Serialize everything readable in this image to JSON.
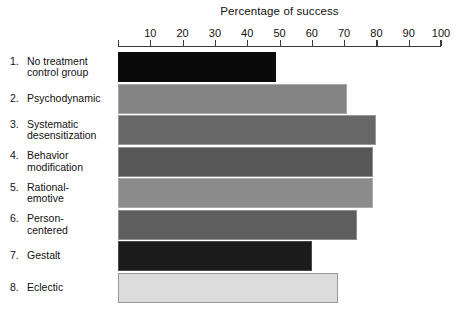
{
  "chart_data": {
    "type": "bar",
    "orientation": "horizontal",
    "title": "Percentage of success",
    "xlabel": "",
    "ylabel": "",
    "xlim": [
      0,
      100
    ],
    "xticks": [
      10,
      20,
      30,
      40,
      50,
      60,
      70,
      80,
      90,
      100
    ],
    "grid": false,
    "legend": null,
    "categories": [
      "No treatment control group",
      "Psychodynamic",
      "Systematic desensitization",
      "Behavior modification",
      "Rational-emotive",
      "Person-centered",
      "Gestalt",
      "Eclectic"
    ],
    "values": [
      49,
      71,
      80,
      79,
      79,
      74,
      60,
      68
    ]
  },
  "title": "Percentage of success",
  "axis": {
    "ticks": [
      {
        "label": "10",
        "value": 10
      },
      {
        "label": "20",
        "value": 20
      },
      {
        "label": "30",
        "value": 30
      },
      {
        "label": "40",
        "value": 40
      },
      {
        "label": "50",
        "value": 50
      },
      {
        "label": "60",
        "value": 60
      },
      {
        "label": "70",
        "value": 70
      },
      {
        "label": "80",
        "value": 80
      },
      {
        "label": "90",
        "value": 90
      },
      {
        "label": "100",
        "value": 100
      }
    ]
  },
  "rows": [
    {
      "num": "1.",
      "line1": "No treatment",
      "line2": "control group",
      "value": 49,
      "color": "#0a0a0a",
      "border": "#0a0a0a"
    },
    {
      "num": "2.",
      "line1": "Psychodynamic",
      "line2": "",
      "value": 71,
      "color": "#838383",
      "border": "#a8a8a8"
    },
    {
      "num": "3.",
      "line1": "Systematic",
      "line2": "desensitization",
      "value": 80,
      "color": "#676767",
      "border": "#9a9a9a"
    },
    {
      "num": "4.",
      "line1": "Behavior",
      "line2": "modification",
      "value": 79,
      "color": "#575757",
      "border": "#8e8e8e"
    },
    {
      "num": "5.",
      "line1": "Rational-",
      "line2": "emotive",
      "value": 79,
      "color": "#8b8b8b",
      "border": "#ababab"
    },
    {
      "num": "6.",
      "line1": "Person-",
      "line2": "centered",
      "value": 74,
      "color": "#5e5e5e",
      "border": "#8e8e8e"
    },
    {
      "num": "7.",
      "line1": "Gestalt",
      "line2": "",
      "value": 60,
      "color": "#1b1b1b",
      "border": "#4a4a4a"
    },
    {
      "num": "8.",
      "line1": "Eclectic",
      "line2": "",
      "value": 68,
      "color": "#dcdcdc",
      "border": "#9a9a9a"
    }
  ]
}
